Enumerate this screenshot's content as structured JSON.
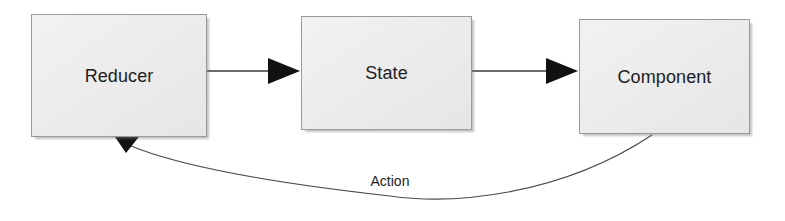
{
  "diagram": {
    "background_color": "#ffffff",
    "node_fill_color": "#ececec",
    "node_border_color": "#9a9a9a",
    "edge_color": "#3a3a3a",
    "text_color": "#1d1d1d",
    "nodes": [
      {
        "id": "reducer",
        "label": "Reducer",
        "shape": "rectangle"
      },
      {
        "id": "state",
        "label": "State",
        "shape": "rectangle"
      },
      {
        "id": "component",
        "label": "Component",
        "shape": "rectangle"
      }
    ],
    "edges": [
      {
        "id": "reducer-to-state",
        "from": "Reducer",
        "to": "State",
        "label": "",
        "style": "straight-arrow"
      },
      {
        "id": "state-to-component",
        "from": "State",
        "to": "Component",
        "label": "",
        "style": "straight-arrow"
      },
      {
        "id": "component-to-reducer",
        "from": "Component",
        "to": "Reducer",
        "label": "Action",
        "style": "curved-arrow"
      }
    ]
  }
}
